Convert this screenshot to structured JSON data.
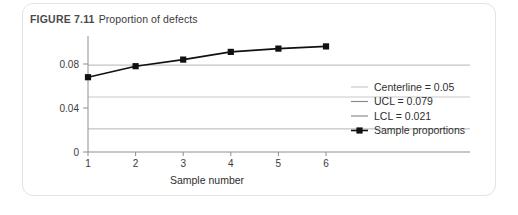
{
  "figure": {
    "label": "FIGURE 7.11",
    "caption": "Proportion of defects"
  },
  "axes": {
    "x_title": "Sample number",
    "x_ticks": [
      "1",
      "2",
      "3",
      "4",
      "5",
      "6"
    ],
    "y_ticks": [
      "0",
      "0.04",
      "0.08"
    ]
  },
  "legend": {
    "items": [
      {
        "label": "Centerline = 0.05",
        "color": "#c9c9c9",
        "type": "line"
      },
      {
        "label": "UCL = 0.079",
        "color": "#8c8c8c",
        "type": "line"
      },
      {
        "label": "LCL = 0.021",
        "color": "#8c8c8c",
        "type": "line"
      },
      {
        "label": "Sample proportions",
        "color": "#111111",
        "type": "line-marker"
      }
    ]
  },
  "colors": {
    "card_border": "#e3e3e3",
    "axis": "#8f8f8f",
    "series": "#111111",
    "centerline": "#c9c9c9",
    "control_limit": "#b4b4b4",
    "text": "#2e2e2e",
    "title_label": "#4a4a4a"
  },
  "chart_data": {
    "type": "line",
    "title": "Proportion of defects",
    "xlabel": "Sample number",
    "ylabel": "",
    "x": [
      1,
      2,
      3,
      4,
      5,
      6
    ],
    "xlim": [
      1,
      6
    ],
    "ylim": [
      0,
      0.1
    ],
    "ytick_values": [
      0,
      0.04,
      0.08
    ],
    "grid": false,
    "legend_position": "right",
    "series": [
      {
        "name": "Sample proportions",
        "type": "line-marker",
        "values": [
          0.068,
          0.078,
          0.084,
          0.091,
          0.094,
          0.096
        ]
      }
    ],
    "reference_lines": [
      {
        "name": "UCL = 0.079",
        "value": 0.079
      },
      {
        "name": "Centerline = 0.05",
        "value": 0.05
      },
      {
        "name": "LCL = 0.021",
        "value": 0.021
      }
    ]
  }
}
